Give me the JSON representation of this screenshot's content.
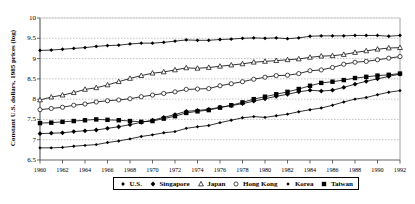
{
  "chart_data": {
    "type": "line",
    "title": "",
    "xlabel": "",
    "ylabel": "Constant U.S. dollars, 1985 prices (log)",
    "xlim": [
      1960,
      1992
    ],
    "ylim": [
      6.5,
      10
    ],
    "yticks": [
      "6.5",
      "7",
      "7.5",
      "8",
      "8.5",
      "9",
      "9.5",
      "10"
    ],
    "xticks": [
      "1960",
      "1962",
      "1964",
      "1966",
      "1968",
      "1970",
      "1972",
      "1974",
      "1976",
      "1978",
      "1980",
      "1982",
      "1984",
      "1986",
      "1988",
      "1990",
      "1992"
    ],
    "grid": true,
    "legend_position": "bottom",
    "x": [
      1960,
      1961,
      1962,
      1963,
      1964,
      1965,
      1966,
      1967,
      1968,
      1969,
      1970,
      1971,
      1972,
      1973,
      1974,
      1975,
      1976,
      1977,
      1978,
      1979,
      1980,
      1981,
      1982,
      1983,
      1984,
      1985,
      1986,
      1987,
      1988,
      1989,
      1990,
      1991,
      1992
    ],
    "series": [
      {
        "name": "U.S.",
        "marker": "small-filled-diamond",
        "color": "#000000",
        "values": [
          9.2,
          9.21,
          9.23,
          9.25,
          9.27,
          9.3,
          9.32,
          9.33,
          9.36,
          9.38,
          9.38,
          9.4,
          9.43,
          9.46,
          9.45,
          9.45,
          9.47,
          9.48,
          9.5,
          9.51,
          9.5,
          9.51,
          9.49,
          9.51,
          9.55,
          9.56,
          9.56,
          9.56,
          9.57,
          9.57,
          9.57,
          9.55,
          9.57
        ]
      },
      {
        "name": "Singapore",
        "marker": "filled-diamond",
        "color": "#000000",
        "values": [
          7.15,
          7.16,
          7.17,
          7.2,
          7.22,
          7.24,
          7.28,
          7.32,
          7.37,
          7.43,
          7.48,
          7.55,
          7.62,
          7.7,
          7.72,
          7.75,
          7.8,
          7.84,
          7.89,
          7.95,
          8.01,
          8.07,
          8.12,
          8.18,
          8.22,
          8.2,
          8.22,
          8.29,
          8.37,
          8.44,
          8.5,
          8.56,
          8.62
        ]
      },
      {
        "name": "Japan",
        "marker": "open-triangle",
        "color": "#000000",
        "values": [
          7.98,
          8.05,
          8.1,
          8.16,
          8.24,
          8.28,
          8.35,
          8.43,
          8.51,
          8.58,
          8.64,
          8.67,
          8.72,
          8.77,
          8.76,
          8.78,
          8.81,
          8.84,
          8.87,
          8.91,
          8.93,
          8.95,
          8.97,
          8.99,
          9.03,
          9.06,
          9.07,
          9.1,
          9.15,
          9.19,
          9.23,
          9.26,
          9.27
        ]
      },
      {
        "name": "Hong Kong",
        "marker": "open-circle",
        "color": "#000000",
        "values": [
          7.74,
          7.77,
          7.8,
          7.85,
          7.88,
          7.93,
          7.96,
          7.98,
          8.01,
          8.06,
          8.1,
          8.14,
          8.18,
          8.24,
          8.25,
          8.26,
          8.33,
          8.38,
          8.43,
          8.49,
          8.54,
          8.58,
          8.59,
          8.63,
          8.7,
          8.72,
          8.78,
          8.86,
          8.91,
          8.93,
          8.97,
          9.01,
          9.05
        ]
      },
      {
        "name": "Korea",
        "marker": "dash",
        "color": "#000000",
        "values": [
          6.8,
          6.8,
          6.81,
          6.84,
          6.86,
          6.88,
          6.93,
          6.97,
          7.02,
          7.08,
          7.12,
          7.17,
          7.2,
          7.28,
          7.32,
          7.35,
          7.42,
          7.48,
          7.54,
          7.57,
          7.55,
          7.59,
          7.63,
          7.69,
          7.74,
          7.78,
          7.85,
          7.93,
          8.0,
          8.04,
          8.11,
          8.17,
          8.21
        ]
      },
      {
        "name": "Taiwan",
        "marker": "filled-square",
        "color": "#000000",
        "values": [
          7.41,
          7.42,
          7.44,
          7.46,
          7.48,
          7.5,
          7.49,
          7.48,
          7.46,
          7.44,
          7.46,
          7.52,
          7.58,
          7.66,
          7.7,
          7.73,
          7.79,
          7.85,
          7.92,
          8.0,
          8.06,
          8.12,
          8.18,
          8.25,
          8.33,
          8.4,
          8.43,
          8.47,
          8.52,
          8.55,
          8.58,
          8.6,
          8.63
        ]
      }
    ]
  },
  "legend": {
    "items": [
      {
        "label": "U.S.",
        "marker": "small-filled-diamond"
      },
      {
        "label": "Singapore",
        "marker": "filled-diamond"
      },
      {
        "label": "Japan",
        "marker": "open-triangle"
      },
      {
        "label": "Hong Kong",
        "marker": "open-circle"
      },
      {
        "label": "Korea",
        "marker": "dash"
      },
      {
        "label": "Taiwan",
        "marker": "filled-square"
      }
    ]
  }
}
